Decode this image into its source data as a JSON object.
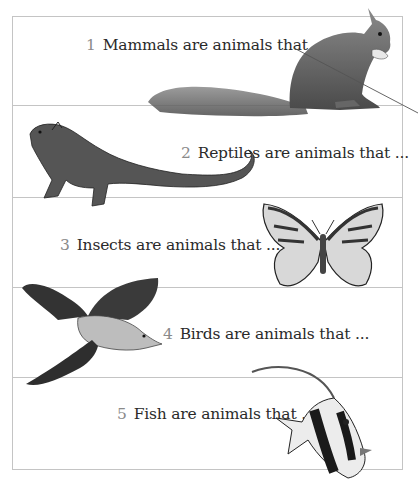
{
  "worksheet": {
    "prompts": [
      {
        "number": "1",
        "text": "Mammals are animals that ...",
        "animal": "squirrel"
      },
      {
        "number": "2",
        "text": "Reptiles are animals that ...",
        "animal": "iguana"
      },
      {
        "number": "3",
        "text": "Insects are animals that ...",
        "animal": "butterfly"
      },
      {
        "number": "4",
        "text": "Birds are animals that ...",
        "animal": "bird"
      },
      {
        "number": "5",
        "text": "Fish are animals that ...",
        "animal": "moorish-idol-fish"
      }
    ]
  },
  "colors": {
    "border": "#c4c4c4",
    "text": "#2a2a2a",
    "numeral": "#8a8a8a"
  }
}
